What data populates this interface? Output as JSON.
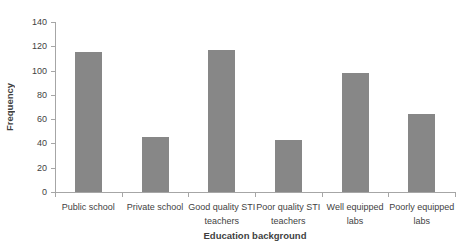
{
  "chart_data": {
    "type": "bar",
    "title": "",
    "xlabel": "Education background",
    "ylabel": "Frequency",
    "categories": [
      "Public school",
      "Private school",
      "Good quality STI teachers",
      "Poor quality STI teachers",
      "Well equipped labs",
      "Poorly equipped labs"
    ],
    "label_lines": [
      [
        "Public school"
      ],
      [
        "Private school"
      ],
      [
        "Good quality STI",
        "teachers"
      ],
      [
        "Poor quality STI",
        "teachers"
      ],
      [
        "Well equipped",
        "labs"
      ],
      [
        "Poorly equipped",
        "labs"
      ]
    ],
    "values": [
      115,
      45,
      117,
      43,
      98,
      64
    ],
    "ylim": [
      0,
      140
    ],
    "yticks": [
      0,
      20,
      40,
      60,
      80,
      100,
      120,
      140
    ],
    "grid": false,
    "legend": false,
    "bar_color": "#878787",
    "axis_color": "#A6A6A6",
    "text_color": "#3F3F3F",
    "background_color": "#FFFFFF"
  }
}
